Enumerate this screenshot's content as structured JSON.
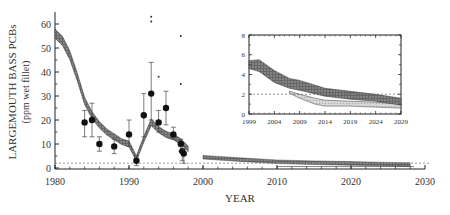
{
  "chart_data": [
    {
      "type": "scatter",
      "title": "",
      "xlabel": "YEAR",
      "ylabel": "LARGEMOUTH BASS PCBs",
      "ylabel_sub": "(ppm wet fillet)",
      "xlim": [
        1980,
        2030
      ],
      "ylim": [
        0,
        65
      ],
      "x_ticks": [
        "1980",
        "1990",
        "2000",
        "2010",
        "2020",
        "2030"
      ],
      "y_ticks": [
        "0",
        "10",
        "20",
        "30",
        "40",
        "50",
        "60"
      ],
      "reference_line": {
        "y": 2,
        "style": "dashed"
      },
      "series": [
        {
          "name": "Observed means with error bars",
          "points": [
            {
              "x": 1984,
              "y": 19,
              "low": 13,
              "high": 24
            },
            {
              "x": 1985,
              "y": 20,
              "low": 13,
              "high": 27
            },
            {
              "x": 1986,
              "y": 10,
              "low": 7,
              "high": 13
            },
            {
              "x": 1988,
              "y": 9,
              "low": 6,
              "high": 12
            },
            {
              "x": 1990,
              "y": 14,
              "low": 9,
              "high": 20
            },
            {
              "x": 1991,
              "y": 3,
              "low": 1,
              "high": 5
            },
            {
              "x": 1992,
              "y": 22,
              "low": 13,
              "high": 31
            },
            {
              "x": 1993,
              "y": 31,
              "low": 20,
              "high": 44
            },
            {
              "x": 1994,
              "y": 19,
              "low": 15,
              "high": 24
            },
            {
              "x": 1995,
              "y": 25,
              "low": 18,
              "high": 32
            },
            {
              "x": 1996,
              "y": 14,
              "low": 12,
              "high": 17
            },
            {
              "x": 1997,
              "y": 10,
              "low": 7,
              "high": 12
            },
            {
              "x": 1997.2,
              "y": 7,
              "low": 3,
              "high": 9
            },
            {
              "x": 1997.4,
              "y": 6,
              "low": 2,
              "high": 8
            }
          ]
        },
        {
          "name": "Outliers",
          "points": [
            {
              "x": 1993,
              "y": 63
            },
            {
              "x": 1993,
              "y": 61
            },
            {
              "x": 1997,
              "y": 55
            },
            {
              "x": 1994,
              "y": 38
            },
            {
              "x": 1997,
              "y": 35
            }
          ]
        },
        {
          "name": "Model band (hindcast)",
          "x": [
            1980,
            1981,
            1982,
            1983,
            1984,
            1985,
            1986,
            1987,
            1988,
            1989,
            1990,
            1991,
            1992,
            1993,
            1994,
            1995,
            1996,
            1997,
            1998
          ],
          "values": [
            56,
            53,
            47,
            38,
            28,
            22,
            18,
            15,
            13,
            11,
            10,
            4,
            12,
            19,
            16,
            14,
            13,
            11,
            8
          ]
        },
        {
          "name": "Model band (forecast)",
          "x": [
            2000,
            2005,
            2010,
            2015,
            2020,
            2025,
            2028
          ],
          "values": [
            4.5,
            3.5,
            2.6,
            2.2,
            1.9,
            1.6,
            1.4
          ]
        }
      ]
    },
    {
      "type": "area",
      "title": "inset",
      "xlabel": "",
      "ylabel": "",
      "xlim": [
        1999,
        2029
      ],
      "ylim": [
        0,
        8
      ],
      "x_ticks": [
        "1999",
        "2004",
        "2009",
        "2014",
        "2019",
        "2024",
        "2029"
      ],
      "y_ticks": [
        "0",
        "2",
        "4",
        "6",
        "8"
      ],
      "reference_line": {
        "y": 2,
        "style": "dashed"
      },
      "series": [
        {
          "name": "Dark band (upper scenario)",
          "x": [
            1999,
            2001,
            2004,
            2007,
            2009,
            2014,
            2019,
            2024,
            2029
          ],
          "upper": [
            5.4,
            5.5,
            4.4,
            3.6,
            3.4,
            2.6,
            2.3,
            2.0,
            1.6
          ],
          "lower": [
            4.6,
            4.3,
            3.2,
            2.6,
            2.4,
            1.8,
            1.5,
            1.3,
            0.9
          ]
        },
        {
          "name": "Light band (lower scenario)",
          "x": [
            2007,
            2009,
            2012,
            2014,
            2019,
            2024,
            2029
          ],
          "upper": [
            2.3,
            2.0,
            1.6,
            1.4,
            1.3,
            1.2,
            1.0
          ],
          "lower": [
            2.1,
            1.6,
            1.0,
            0.8,
            0.8,
            0.7,
            0.6
          ]
        }
      ]
    }
  ]
}
